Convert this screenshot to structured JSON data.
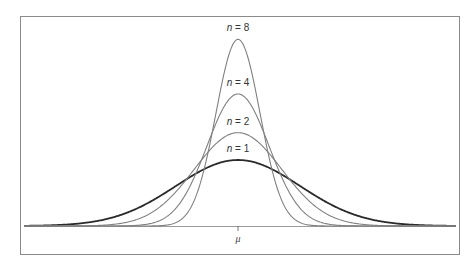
{
  "chart_data": {
    "type": "line",
    "title": "",
    "xlabel": "",
    "ylabel": "",
    "x_tick_labels": [
      "μ"
    ],
    "grid": false,
    "legend": "inline labels above each peak",
    "series": [
      {
        "name": "n = 1",
        "n": 1,
        "relative_sd": 1.0,
        "relative_peak_height": 1.0,
        "color": "#2a2a2a",
        "stroke_width": 1.8
      },
      {
        "name": "n = 2",
        "n": 2,
        "relative_sd": 0.707,
        "relative_peak_height": 1.414,
        "color": "#808080",
        "stroke_width": 1.1
      },
      {
        "name": "n = 4",
        "n": 4,
        "relative_sd": 0.5,
        "relative_peak_height": 2.0,
        "color": "#808080",
        "stroke_width": 1.1
      },
      {
        "name": "n = 8",
        "n": 8,
        "relative_sd": 0.354,
        "relative_peak_height": 2.828,
        "color": "#808080",
        "stroke_width": 1.1
      }
    ]
  },
  "figure": {
    "frame": {
      "x": 20,
      "y": 16,
      "width": 439,
      "height": 238,
      "color": "#8a8a8a"
    },
    "baseline": {
      "y": 226,
      "x_start": 24,
      "x_end": 456,
      "color": "#9a9a9a"
    },
    "mu": {
      "x": 238,
      "label": "μ"
    },
    "base_sd_px": 62,
    "base_peak_px": 66,
    "label_offset_px": 12,
    "label_var": "n",
    "label_eq": " = "
  }
}
